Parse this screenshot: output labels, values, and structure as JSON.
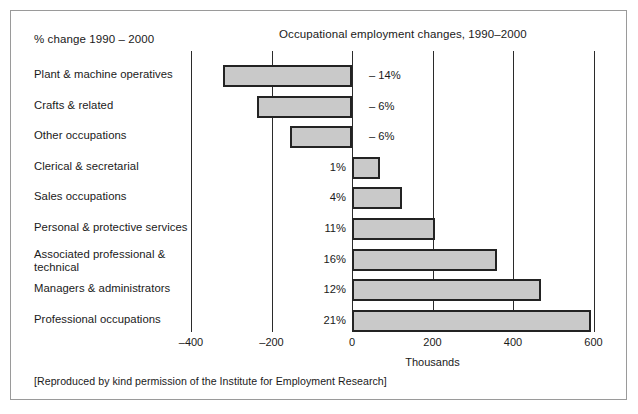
{
  "figure": {
    "subtitle": "% change 1990 – 2000",
    "title": "Occupational employment changes, 1990–2000",
    "footer": "[Reproduced by kind permission of the Institute for Employment Research]",
    "frame_color": "#9a9a9a",
    "bar_fill": "#c9c9c9",
    "bar_stroke": "#232323",
    "background": "#ffffff"
  },
  "chart_data": {
    "type": "bar",
    "orientation": "horizontal",
    "title": "Occupational employment changes, 1990–2000",
    "subtitle": "% change 1990 – 2000",
    "xlabel": "Thousands",
    "ylabel": "",
    "xlim": [
      -440,
      620
    ],
    "xticks": [
      -400,
      -200,
      0,
      200,
      400,
      600
    ],
    "xtick_labels": [
      "–400",
      "–200",
      "0",
      "200",
      "400",
      "600"
    ],
    "grid": true,
    "legend": false,
    "categories": [
      "Plant & machine operatives",
      "Crafts & related",
      "Other occupations",
      "Clerical & secretarial",
      "Sales occupations",
      "Personal & protective services",
      "Associated professional &\ntechnical",
      "Managers & administrators",
      "Professional occupations"
    ],
    "values": [
      -320,
      -235,
      -155,
      70,
      125,
      207,
      360,
      470,
      595
    ],
    "value_unit": "thousands",
    "data_labels": [
      "– 14%",
      "– 6%",
      "– 6%",
      "1%",
      "4%",
      "11%",
      "16%",
      "12%",
      "21%"
    ],
    "percent_change": [
      -14,
      -6,
      -6,
      1,
      4,
      11,
      16,
      12,
      21
    ]
  }
}
